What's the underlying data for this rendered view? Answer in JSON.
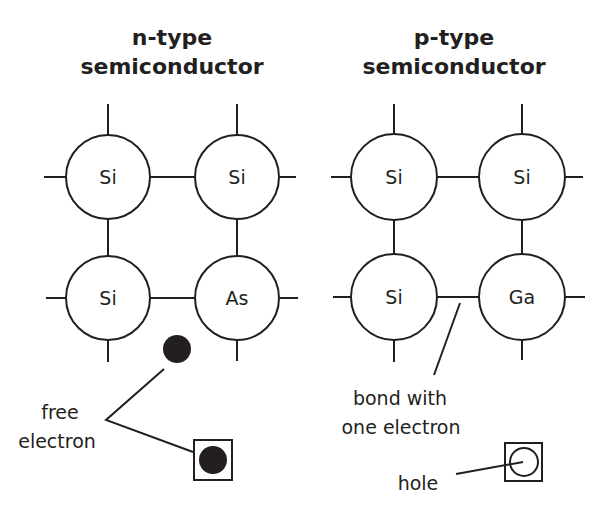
{
  "left_panel": {
    "title_line1": "n-type",
    "title_line2": "semiconductor",
    "atoms": [
      "Si",
      "Si",
      "Si",
      "As"
    ],
    "label_line1": "free",
    "label_line2": "electron"
  },
  "right_panel": {
    "title_line1": "p-type",
    "title_line2": "semiconductor",
    "atoms": [
      "Si",
      "Si",
      "Si",
      "Ga"
    ],
    "bond_label_line1": "bond with",
    "bond_label_line2": "one electron",
    "hole_label": "hole"
  },
  "colors": {
    "ink": "#231f20",
    "background": "#ffffff"
  }
}
